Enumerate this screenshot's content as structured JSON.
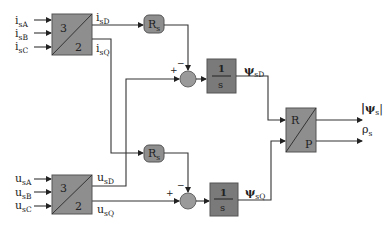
{
  "diagram": {
    "inputs_current": [
      {
        "main": "i",
        "sub": "sA"
      },
      {
        "main": "i",
        "sub": "sB"
      },
      {
        "main": "i",
        "sub": "sC"
      }
    ],
    "inputs_voltage": [
      {
        "main": "u",
        "sub": "sA"
      },
      {
        "main": "u",
        "sub": "sB"
      },
      {
        "main": "u",
        "sub": "sC"
      }
    ],
    "transform_current": {
      "top": "3",
      "bottom": "2",
      "out_d": {
        "main": "i",
        "sub": "sD"
      },
      "out_q": {
        "main": "i",
        "sub": "sQ"
      }
    },
    "transform_voltage": {
      "top": "3",
      "bottom": "2",
      "out_d": {
        "main": "u",
        "sub": "sD"
      },
      "out_q": {
        "main": "u",
        "sub": "sQ"
      }
    },
    "resistor_d": {
      "main": "R",
      "sub": "s"
    },
    "resistor_q": {
      "main": "R",
      "sub": "s"
    },
    "summer_d": {
      "plus": "+",
      "minus": "−"
    },
    "summer_q": {
      "plus": "+",
      "minus": "−"
    },
    "integrator_d": {
      "num": "1",
      "den": "s",
      "out": {
        "main": "ψ",
        "sub": "sD"
      }
    },
    "integrator_q": {
      "num": "1",
      "den": "s",
      "out": {
        "main": "ψ",
        "sub": "sQ"
      }
    },
    "polar": {
      "top": "R",
      "bottom": "P"
    },
    "outputs": [
      {
        "main": "|ψ",
        "sub": "s",
        "suffix": "|"
      },
      {
        "main": "ρ",
        "sub": "s",
        "suffix": ""
      }
    ]
  }
}
